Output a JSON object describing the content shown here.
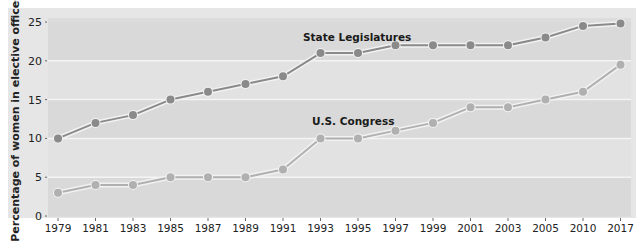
{
  "chart_data": {
    "type": "line",
    "title": "",
    "xlabel": "",
    "ylabel": "Percentage of women in elective offices",
    "ylim": [
      0,
      25
    ],
    "yticks": [
      0,
      5,
      10,
      15,
      20,
      25
    ],
    "grid": true,
    "legend_position": "inline labels",
    "categories": [
      "1979",
      "1981",
      "1983",
      "1985",
      "1987",
      "1989",
      "1991",
      "1993",
      "1995",
      "1997",
      "1999",
      "2001",
      "2003",
      "2005",
      "2010",
      "2017"
    ],
    "series": [
      {
        "name": "State Legislatures",
        "color": "#8a8a8a",
        "values": [
          10,
          12,
          13,
          15,
          16,
          17,
          18,
          21,
          21,
          22,
          22,
          22,
          22,
          23,
          24.5,
          24.8
        ]
      },
      {
        "name": "U.S. Congress",
        "color": "#b0b0b0",
        "values": [
          3,
          4,
          4,
          5,
          5,
          5,
          6,
          10,
          10,
          11,
          12,
          14,
          14,
          15,
          16,
          19.5
        ]
      }
    ],
    "annotations": [
      {
        "text": "State Legislatures",
        "near": "1993-1995",
        "series": 0
      },
      {
        "text": "U.S. Congress",
        "near": "1993-1995",
        "series": 1
      }
    ]
  },
  "labels": {
    "ylabel": "Percentage of women in elective offices",
    "state": "State Legislatures",
    "congress": "U.S. Congress"
  }
}
